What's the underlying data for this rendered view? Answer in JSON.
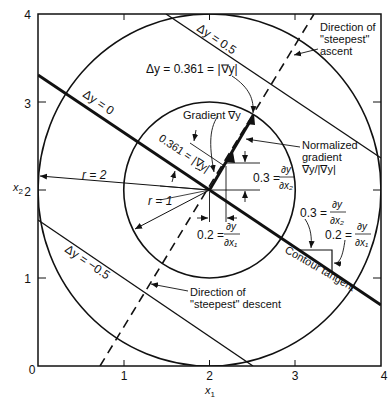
{
  "axes": {
    "x_label": "x",
    "x_label_sub": "1",
    "y_label": "x",
    "y_label_sub": "2",
    "origin": "0",
    "x_ticks": [
      "1",
      "2",
      "3",
      "4"
    ],
    "y_ticks": [
      "1",
      "2",
      "3",
      "4"
    ]
  },
  "contours": {
    "zero": "Δy = 0",
    "plus": "Δy = 0.5",
    "minus": "Δy = −0.5",
    "circle_point": "Δy = 0.361 = |∇y|"
  },
  "radii": {
    "outer": "r = 2",
    "inner": "r = 1"
  },
  "annotations": {
    "gradient": "Gradient ∇y",
    "normalized_line1": "Normalized",
    "normalized_line2": "gradient",
    "normalized_line3": "∇y/|∇y|",
    "ascent_line1": "Direction of",
    "ascent_line2": "\"steepest\"",
    "ascent_line3": "ascent",
    "descent_line1": "Direction of",
    "descent_line2": "\"steepest\" descent",
    "contour_tangent": "Contour tangent",
    "grad_magnitude": "0.361 = |∇y|",
    "dx2_value": "0.3 =",
    "dx1_value": "0.2 =",
    "dy_num": "∂y",
    "dx1_den": "∂x₁",
    "dx2_den": "∂x₂"
  }
}
